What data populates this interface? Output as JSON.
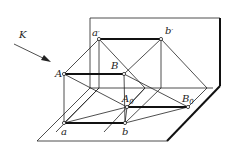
{
  "diagram": {
    "direction_label": "K",
    "points": {
      "a_prime": {
        "label": "a",
        "mark": "′",
        "x": 99,
        "y": 39
      },
      "b_prime": {
        "label": "b",
        "mark": "′",
        "x": 161,
        "y": 39
      },
      "A": {
        "label": "A",
        "x": 64,
        "y": 74
      },
      "B": {
        "label": "B",
        "x": 124,
        "y": 74
      },
      "A0": {
        "label": "A",
        "sub": "0",
        "x": 127,
        "y": 107
      },
      "B0": {
        "label": "B",
        "sub": "0",
        "x": 188,
        "y": 107
      },
      "a": {
        "label": "a",
        "x": 64,
        "y": 123
      },
      "b": {
        "label": "b",
        "x": 125,
        "y": 123
      }
    },
    "colors": {
      "line": "#222222",
      "background": "#ffffff"
    }
  }
}
